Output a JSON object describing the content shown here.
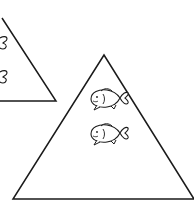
{
  "diagram": {
    "stroke_color": "#1a1a1a",
    "background": "#ffffff",
    "shapes": [
      {
        "name": "small-triangle",
        "label": "",
        "fish_count": 2
      },
      {
        "name": "large-triangle",
        "label": "",
        "fish_count": 2
      }
    ],
    "icons": [
      "fish-icon",
      "fish-icon",
      "fish-tail-icon",
      "fish-tail-icon"
    ]
  }
}
